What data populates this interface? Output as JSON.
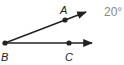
{
  "diagram": {
    "type": "angle",
    "angle_name": "ABC",
    "measure_label": "20°",
    "vertex": {
      "label": "B",
      "x": 5,
      "y": 43
    },
    "rays": [
      {
        "through": "A",
        "point": {
          "label": "A",
          "x": 65,
          "y": 20
        },
        "end": {
          "x": 87,
          "y": 12
        }
      },
      {
        "through": "C",
        "point": {
          "label": "C",
          "x": 69,
          "y": 43
        },
        "end": {
          "x": 92,
          "y": 43
        }
      }
    ],
    "colors": {
      "line": "#222222",
      "measure": "#888888"
    }
  }
}
